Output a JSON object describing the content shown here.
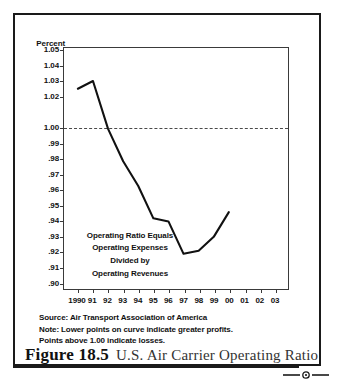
{
  "figure": {
    "number_label": "Figure 18.5",
    "title": "U.S. Air Carrier Operating Ratio"
  },
  "notes": {
    "source": "Source: Air Transport Association of America",
    "note_line_1": "Note: Lower points on curve indicate greater profits.",
    "note_line_2": "Points above 1.00 indicate losses."
  },
  "annotation": {
    "line_1": "Operating Ratio Equals",
    "line_2": "Operating Expenses",
    "line_3": "Divided by",
    "line_4": "Operating Revenues"
  },
  "colors": {
    "line": "#111111",
    "reference_line": "#4a4a4a",
    "axis": "#3a3a3a",
    "frame": "#1a1a1a",
    "text": "#111111",
    "background": "#ffffff"
  },
  "chart_data": {
    "type": "line",
    "title": "U.S. Air Carrier Operating Ratio",
    "xlabel": "",
    "ylabel": "Percent",
    "ylim": [
      0.9,
      1.055
    ],
    "xlim": [
      1990,
      2003
    ],
    "grid": false,
    "legend": "none",
    "y_tick_labels": [
      "1.05",
      "1.04",
      "1.03",
      "1.02",
      "1.00",
      ".99",
      ".98",
      ".97",
      ".96",
      ".95",
      ".94",
      ".93",
      ".92",
      ".91",
      ".90"
    ],
    "y_tick_values": [
      1.05,
      1.04,
      1.03,
      1.02,
      1.0,
      0.99,
      0.98,
      0.97,
      0.96,
      0.95,
      0.94,
      0.93,
      0.92,
      0.91,
      0.9
    ],
    "x_tick_labels": [
      "1990",
      "91",
      "92",
      "93",
      "94",
      "95",
      "96",
      "97",
      "98",
      "99",
      "00",
      "01",
      "02",
      "03"
    ],
    "x_tick_values": [
      1990,
      1991,
      1992,
      1993,
      1994,
      1995,
      1996,
      1997,
      1998,
      1999,
      2000,
      2001,
      2002,
      2003
    ],
    "categories": [
      1990,
      1991,
      1992,
      1993,
      1994,
      1995,
      1996,
      1997,
      1998,
      1999,
      2000
    ],
    "values": [
      1.025,
      1.03,
      0.999,
      0.978,
      0.962,
      0.941,
      0.939,
      0.918,
      0.92,
      0.929,
      0.945
    ],
    "series": [
      {
        "name": "U.S. Air Carrier Operating Ratio",
        "values": [
          1.025,
          1.03,
          0.999,
          0.978,
          0.962,
          0.941,
          0.939,
          0.918,
          0.92,
          0.929,
          0.945
        ]
      }
    ],
    "reference_line": {
      "value": 1.0,
      "style": "dashed",
      "label": "1.00 break-even"
    },
    "annotations": [
      "Operating Ratio Equals",
      "Operating Expenses",
      "Divided by",
      "Operating Revenues"
    ]
  }
}
